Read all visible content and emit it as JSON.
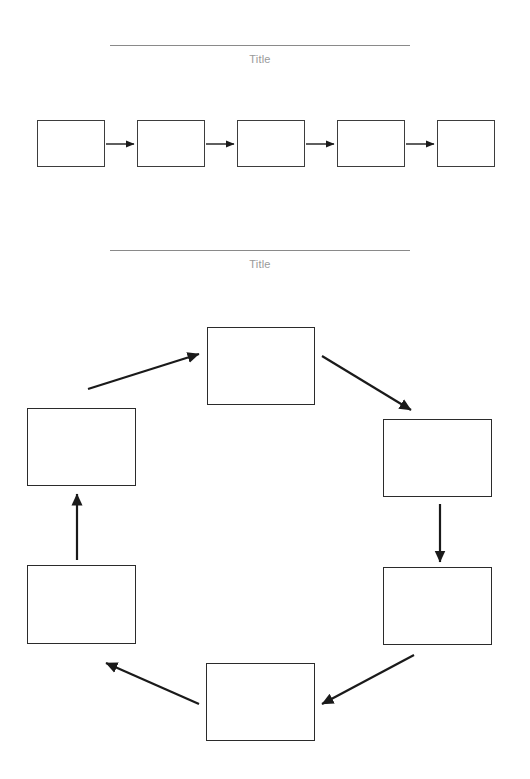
{
  "document": {
    "background_color": "#ffffff",
    "width": 530,
    "height": 779
  },
  "sections": [
    {
      "id": "linear-process",
      "title": "Title",
      "rule": {
        "x": 110,
        "y": 45,
        "width": 300,
        "color": "#8a8a8a"
      },
      "title_color": "#9a9a9a",
      "shape_count": 5,
      "shape_border_color": "#3d3d3d",
      "arrow_color": "#1a1a1a",
      "boxes": [
        {
          "label": "",
          "x": 37,
          "y": 120,
          "width": 68,
          "height": 47
        },
        {
          "label": "",
          "x": 137,
          "y": 120,
          "width": 68,
          "height": 47
        },
        {
          "label": "",
          "x": 237,
          "y": 120,
          "width": 68,
          "height": 47
        },
        {
          "label": "",
          "x": 337,
          "y": 120,
          "width": 68,
          "height": 47
        },
        {
          "label": "",
          "x": 437,
          "y": 120,
          "width": 58,
          "height": 47
        }
      ],
      "arrows": [
        {
          "x1": 106,
          "y1": 144,
          "x2": 134,
          "y2": 144
        },
        {
          "x1": 206,
          "y1": 144,
          "x2": 234,
          "y2": 144
        },
        {
          "x1": 306,
          "y1": 144,
          "x2": 334,
          "y2": 144
        },
        {
          "x1": 406,
          "y1": 144,
          "x2": 434,
          "y2": 144
        }
      ]
    },
    {
      "id": "cycle-process",
      "title": "Title",
      "rule": {
        "x": 110,
        "y": 250,
        "width": 300,
        "color": "#8a8a8a"
      },
      "title_color": "#9a9a9a",
      "shape_count": 6,
      "shape_border_color": "#2b2b2b",
      "arrow_color": "#1a1a1a",
      "boxes": [
        {
          "label": "",
          "position": "top",
          "x": 207,
          "y": 327,
          "width": 108,
          "height": 78
        },
        {
          "label": "",
          "position": "upper-right",
          "x": 383,
          "y": 419,
          "width": 109,
          "height": 78
        },
        {
          "label": "",
          "position": "lower-right",
          "x": 383,
          "y": 567,
          "width": 109,
          "height": 78
        },
        {
          "label": "",
          "position": "bottom",
          "x": 206,
          "y": 663,
          "width": 109,
          "height": 78
        },
        {
          "label": "",
          "position": "lower-left",
          "x": 27,
          "y": 565,
          "width": 109,
          "height": 79
        },
        {
          "label": "",
          "position": "upper-left",
          "x": 27,
          "y": 408,
          "width": 109,
          "height": 78
        }
      ],
      "arrows": [
        {
          "from": "top",
          "to": "upper-right",
          "x1": 322,
          "y1": 356,
          "x2": 411,
          "y2": 410
        },
        {
          "from": "upper-right",
          "to": "lower-right",
          "x1": 440,
          "y1": 504,
          "x2": 440,
          "y2": 562
        },
        {
          "from": "lower-right",
          "to": "bottom",
          "x1": 414,
          "y1": 655,
          "x2": 322,
          "y2": 704
        },
        {
          "from": "bottom",
          "to": "lower-left",
          "x1": 199,
          "y1": 704,
          "x2": 106,
          "y2": 663
        },
        {
          "from": "lower-left",
          "to": "upper-left",
          "x1": 77,
          "y1": 560,
          "x2": 77,
          "y2": 494
        },
        {
          "from": "upper-left",
          "to": "top",
          "x1": 88,
          "y1": 389,
          "x2": 199,
          "y2": 354
        }
      ]
    }
  ]
}
